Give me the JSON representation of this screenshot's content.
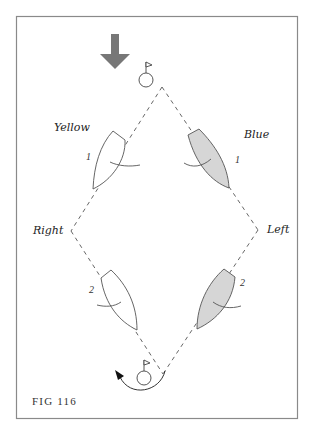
{
  "figure": {
    "caption": "FIG 116",
    "frame": {
      "x": 16,
      "y": 16,
      "width": 281,
      "height": 402,
      "stroke": "#888888"
    },
    "wind_arrow": {
      "direction": "down",
      "color": "#777777"
    },
    "marks": [
      {
        "name": "windward-mark",
        "cx": 146,
        "cy": 80,
        "r": 7
      },
      {
        "name": "leeward-mark",
        "cx": 144,
        "cy": 378,
        "r": 7
      }
    ],
    "diamond": {
      "top": [
        162,
        87
      ],
      "left": [
        71,
        231
      ],
      "bottom": [
        163,
        374
      ],
      "right": [
        258,
        230
      ]
    },
    "labels": {
      "yellow": "Yellow",
      "blue": "Blue",
      "right": "Right",
      "left": "Left"
    },
    "boats": [
      {
        "team": "Yellow",
        "position": "1",
        "fill": "#ffffff"
      },
      {
        "team": "Blue",
        "position": "1",
        "fill": "#d6d6d6"
      },
      {
        "team": "Yellow",
        "position": "2",
        "fill": "#ffffff"
      },
      {
        "team": "Blue",
        "position": "2",
        "fill": "#d6d6d6"
      }
    ],
    "colors": {
      "line": "#555555",
      "boat_fill_blue": "#d6d6d6",
      "arrow": "#777777"
    }
  }
}
